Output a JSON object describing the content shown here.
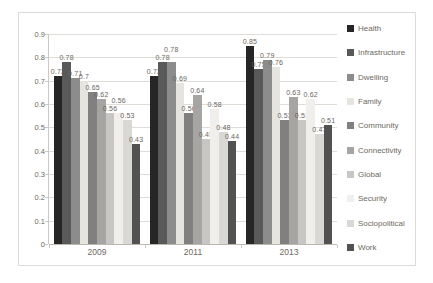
{
  "chart_data": {
    "type": "bar",
    "title": "",
    "categories": [
      "2009",
      "2011",
      "2013"
    ],
    "series": [
      {
        "name": "Health",
        "color": "#262626",
        "values": [
          0.72,
          0.72,
          0.85
        ]
      },
      {
        "name": "Infrastructure",
        "color": "#595959",
        "values": [
          0.78,
          0.78,
          0.75
        ]
      },
      {
        "name": "Dwelling",
        "color": "#8c8c8c",
        "values": [
          0.71,
          0.78,
          0.79
        ]
      },
      {
        "name": "Family",
        "color": "#e6e4df",
        "values": [
          0.7,
          0.69,
          0.76
        ]
      },
      {
        "name": "Community",
        "color": "#808080",
        "values": [
          0.65,
          0.56,
          0.53
        ]
      },
      {
        "name": "Connectivity",
        "color": "#a6a5a3",
        "values": [
          0.62,
          0.64,
          0.63
        ]
      },
      {
        "name": "Global",
        "color": "#c7c6c3",
        "values": [
          0.56,
          0.45,
          0.53
        ]
      },
      {
        "name": "Security",
        "color": "#f0efec",
        "values": [
          0.56,
          0.58,
          0.62
        ]
      },
      {
        "name": "Sociopolitical",
        "color": "#d9d8d4",
        "values": [
          0.53,
          0.48,
          0.47
        ]
      },
      {
        "name": "Work",
        "color": "#525252",
        "values": [
          0.43,
          0.44,
          0.51
        ]
      }
    ],
    "xlabel": "",
    "ylabel": "",
    "ylim": [
      0,
      0.9
    ],
    "ytick_step": 0.1,
    "yticks": [
      "0",
      "0.1",
      "0.2",
      "0.3",
      "0.4",
      "0.5",
      "0.6",
      "0.7",
      "0.8",
      "0.9"
    ],
    "grid": true,
    "value_labels": true,
    "legend_position": "right"
  },
  "style": {
    "grid_color": "#e0ddd8",
    "axis_color": "#bcb8b1",
    "text_color": "#6e6961",
    "value_label_color": "#6b665e",
    "frame_border_color": "#dedbd6",
    "background": "#ffffff"
  }
}
